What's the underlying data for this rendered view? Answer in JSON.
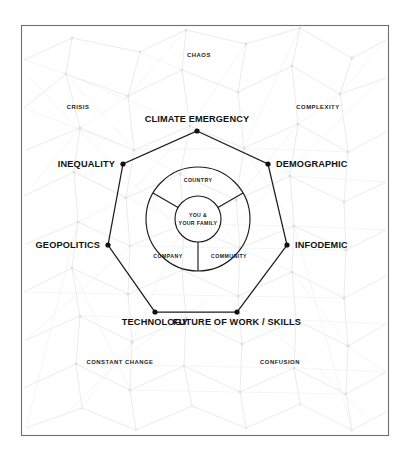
{
  "figure": {
    "frame": {
      "border_color": "#6f6f6f",
      "background_color": "#ffffff"
    },
    "accent_color": "#1c1c1c",
    "network_color": "#e3e3e5"
  },
  "heptagon": {
    "vertices": [
      {
        "id": "climate-emergency",
        "label": "CLIMATE EMERGENCY",
        "x": 197,
        "y": 131,
        "label_x": 197,
        "label_y": 122,
        "anchor": "middle"
      },
      {
        "id": "demographic",
        "label": "DEMOGRAPHIC",
        "x": 268,
        "y": 164,
        "label_x": 276,
        "label_y": 167,
        "anchor": "start"
      },
      {
        "id": "infodemic",
        "label": "INFODEMIC",
        "x": 287,
        "y": 245,
        "label_x": 295,
        "label_y": 248,
        "anchor": "start"
      },
      {
        "id": "future-of-work-skills",
        "label": "FUTURE OF WORK / SKILLS",
        "x": 237,
        "y": 312,
        "label_x": 237,
        "label_y": 325,
        "anchor": "middle"
      },
      {
        "id": "technology",
        "label": "TECHNOLOGY",
        "x": 155,
        "y": 312,
        "label_x": 155,
        "label_y": 325,
        "anchor": "middle"
      },
      {
        "id": "geopolitics",
        "label": "GEOPOLITICS",
        "x": 108,
        "y": 245,
        "label_x": 100,
        "label_y": 248,
        "anchor": "end"
      },
      {
        "id": "inequality",
        "label": "INEQUALITY",
        "x": 123,
        "y": 164,
        "label_x": 115,
        "label_y": 167,
        "anchor": "end"
      }
    ]
  },
  "ambient_labels": [
    {
      "id": "chaos",
      "label": "CHAOS",
      "x": 199,
      "y": 57
    },
    {
      "id": "complexity",
      "label": "COMPLEXITY",
      "x": 318,
      "y": 109
    },
    {
      "id": "crisis",
      "label": "CRISIS",
      "x": 78,
      "y": 109
    },
    {
      "id": "constant-change",
      "label": "CONSTANT CHANGE",
      "x": 120,
      "y": 364
    },
    {
      "id": "confusion",
      "label": "CONFUSION",
      "x": 280,
      "y": 364
    }
  ],
  "rings": {
    "center_x": 198,
    "center_y": 219,
    "outer_radius": 52,
    "inner_radius": 23,
    "sectors": [
      {
        "id": "country",
        "label": "COUNTRY",
        "x": 198,
        "y": 182
      },
      {
        "id": "company",
        "label": "COMPANY",
        "x": 168,
        "y": 258
      },
      {
        "id": "community",
        "label": "COMMUNITY",
        "x": 229,
        "y": 258
      }
    ],
    "core": {
      "id": "you-and-your-family",
      "lines": [
        "YOU &",
        "YOUR FAMILY"
      ],
      "x": 198,
      "y": 216
    }
  }
}
